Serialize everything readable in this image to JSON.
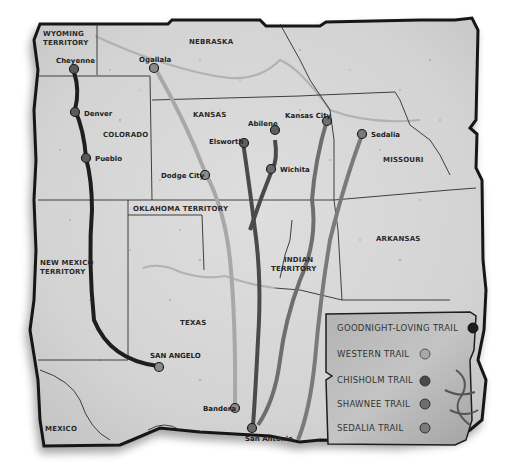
{
  "map": {
    "regions": {
      "wyoming_line1": "WYOMING",
      "wyoming_line2": "TERRITORY",
      "nebraska": "NEBRASKA",
      "colorado": "COLORADO",
      "kansas": "KANSAS",
      "missouri": "MISSOURI",
      "oklahoma": "OKLAHOMA TERRITORY",
      "new_mexico_line1": "NEW MEXICO",
      "new_mexico_line2": "TERRITORY",
      "indian_line1": "INDIAN",
      "indian_line2": "TERRITORY",
      "arkansas": "ARKANSAS",
      "texas": "TEXAS",
      "mexico": "MEXICO"
    },
    "cities": {
      "cheyenne": "Cheyenne",
      "denver": "Denver",
      "pueblo": "Pueblo",
      "ogallala": "Ogallala",
      "dodge_city": "Dodge City",
      "ellsworth": "Elsworth",
      "abilene": "Abilene",
      "wichita": "Wichita",
      "kansas_city": "Kansas City",
      "sedalia": "Sedalia",
      "san_angelo": "SAN ANGELO",
      "bandera": "Bandera",
      "san_antonio": "San Antonio"
    }
  },
  "legend": {
    "items": [
      {
        "label": "GOODNIGHT-LOVING TRAIL",
        "color": "#1e1e1e"
      },
      {
        "label": "WESTERN TRAIL",
        "color": "#a8a8a8"
      },
      {
        "label": "CHISHOLM TRAIL",
        "color": "#4a4a4a"
      },
      {
        "label": "SHAWNEE TRAIL",
        "color": "#6e6e6e"
      },
      {
        "label": "SEDALIA TRAIL",
        "color": "#7a7a7a"
      }
    ]
  },
  "colors": {
    "parchment": "#d9d9d9",
    "parchment_dark": "#bdbdbd",
    "legend_bg": "#a9a9a9",
    "outline": "#161616"
  }
}
